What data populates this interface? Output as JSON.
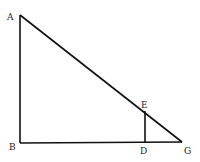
{
  "diagram": {
    "type": "geometry",
    "points": [
      {
        "id": "A",
        "label": "A",
        "x": 20,
        "y": 15,
        "lx": 7,
        "ly": 20
      },
      {
        "id": "B",
        "label": "B",
        "x": 20,
        "y": 143,
        "lx": 9,
        "ly": 150
      },
      {
        "id": "D",
        "label": "D",
        "x": 145,
        "y": 142,
        "lx": 140,
        "ly": 154
      },
      {
        "id": "E",
        "label": "E",
        "x": 145,
        "y": 111,
        "lx": 141,
        "ly": 108
      },
      {
        "id": "G",
        "label": "G",
        "x": 182,
        "y": 142,
        "lx": 184,
        "ly": 154
      }
    ],
    "segments": [
      {
        "from": "A",
        "to": "B"
      },
      {
        "from": "B",
        "to": "G"
      },
      {
        "from": "A",
        "to": "G"
      },
      {
        "from": "D",
        "to": "E"
      }
    ],
    "labels": {
      "A": "A",
      "B": "B",
      "D": "D",
      "E": "E",
      "G": "G"
    }
  }
}
